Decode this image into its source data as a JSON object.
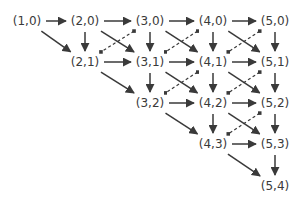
{
  "diagram": {
    "type": "directed-graph",
    "nodes": [
      {
        "id": "1,0",
        "label": "(1,0)",
        "x": 27,
        "y": 21
      },
      {
        "id": "2,0",
        "label": "(2,0)",
        "x": 85,
        "y": 21
      },
      {
        "id": "3,0",
        "label": "(3,0)",
        "x": 150,
        "y": 21
      },
      {
        "id": "4,0",
        "label": "(4,0)",
        "x": 213,
        "y": 21
      },
      {
        "id": "5,0",
        "label": "(5,0)",
        "x": 275,
        "y": 21
      },
      {
        "id": "2,1",
        "label": "(2,1)",
        "x": 85,
        "y": 62
      },
      {
        "id": "3,1",
        "label": "(3,1)",
        "x": 150,
        "y": 62
      },
      {
        "id": "4,1",
        "label": "(4,1)",
        "x": 213,
        "y": 62
      },
      {
        "id": "5,1",
        "label": "(5,1)",
        "x": 275,
        "y": 62
      },
      {
        "id": "3,2",
        "label": "(3,2)",
        "x": 150,
        "y": 103
      },
      {
        "id": "4,2",
        "label": "(4,2)",
        "x": 213,
        "y": 103
      },
      {
        "id": "5,2",
        "label": "(5,2)",
        "x": 275,
        "y": 103
      },
      {
        "id": "4,3",
        "label": "(4,3)",
        "x": 213,
        "y": 144
      },
      {
        "id": "5,3",
        "label": "(5,3)",
        "x": 275,
        "y": 144
      },
      {
        "id": "5,4",
        "label": "(5,4)",
        "x": 275,
        "y": 186
      }
    ],
    "solid_edges": [
      [
        "1,0",
        "2,0"
      ],
      [
        "1,0",
        "2,1"
      ],
      [
        "2,0",
        "3,0"
      ],
      [
        "2,0",
        "2,1"
      ],
      [
        "2,0",
        "3,1"
      ],
      [
        "3,0",
        "4,0"
      ],
      [
        "3,0",
        "3,1"
      ],
      [
        "3,0",
        "4,1"
      ],
      [
        "4,0",
        "5,0"
      ],
      [
        "4,0",
        "4,1"
      ],
      [
        "4,0",
        "5,1"
      ],
      [
        "5,0",
        "5,1"
      ],
      [
        "2,1",
        "3,1"
      ],
      [
        "2,1",
        "3,2"
      ],
      [
        "3,1",
        "4,1"
      ],
      [
        "3,1",
        "3,2"
      ],
      [
        "3,1",
        "4,2"
      ],
      [
        "4,1",
        "5,1"
      ],
      [
        "4,1",
        "4,2"
      ],
      [
        "4,1",
        "5,2"
      ],
      [
        "5,1",
        "5,2"
      ],
      [
        "3,2",
        "4,2"
      ],
      [
        "3,2",
        "4,3"
      ],
      [
        "4,2",
        "5,2"
      ],
      [
        "4,2",
        "4,3"
      ],
      [
        "4,2",
        "5,3"
      ],
      [
        "5,2",
        "5,3"
      ],
      [
        "4,3",
        "5,3"
      ],
      [
        "4,3",
        "5,4"
      ],
      [
        "5,3",
        "5,4"
      ]
    ],
    "dashed_edges": [
      [
        "3,0",
        "2,1"
      ],
      [
        "4,0",
        "3,1"
      ],
      [
        "5,0",
        "4,1"
      ],
      [
        "4,1",
        "3,2"
      ],
      [
        "5,1",
        "4,2"
      ],
      [
        "5,2",
        "4,3"
      ]
    ],
    "colors": {
      "stroke": "#3a3a3a",
      "text": "#3a3a3a",
      "background": "#ffffff"
    }
  }
}
